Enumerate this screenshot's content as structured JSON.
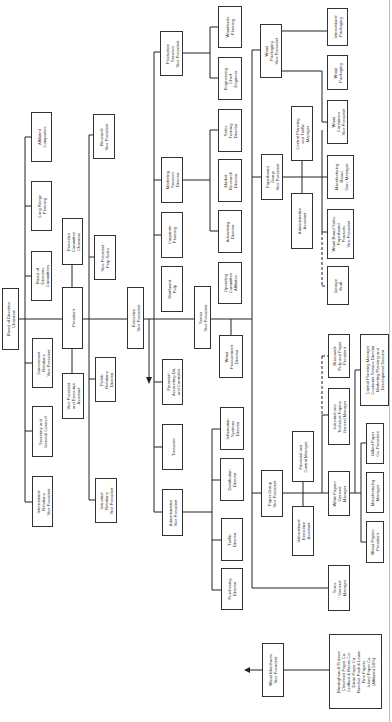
{
  "chart_title": "",
  "nodes": [
    {
      "id": "board",
      "label": "Board of Directors\nChairman",
      "x": 2,
      "y": 288,
      "w": 17,
      "h": 62
    },
    {
      "id": "president",
      "label": "President",
      "x": 62,
      "y": 287,
      "w": 21,
      "h": 62
    },
    {
      "id": "vp_exec_asst",
      "label": "Vice President\nand Executive\nAssistant",
      "x": 62,
      "y": 373,
      "w": 22,
      "h": 46
    },
    {
      "id": "exec_committee",
      "label": "Executive\nCommittee\nChairman",
      "x": 62,
      "y": 218,
      "w": 21,
      "h": 47
    },
    {
      "id": "affiliated",
      "label": "Affiliated\nCompanies",
      "x": 31,
      "y": 112,
      "w": 21,
      "h": 50
    },
    {
      "id": "long_range",
      "label": "Long Range\nPlanning",
      "x": 31,
      "y": 181,
      "w": 21,
      "h": 50
    },
    {
      "id": "board_committees",
      "label": "Board of\nDirectors\nCommittees",
      "x": 31,
      "y": 251,
      "w": 21,
      "h": 50
    },
    {
      "id": "govt_relations",
      "label": "Government\nRelations\nVice President",
      "x": 32,
      "y": 338,
      "w": 21,
      "h": 50
    },
    {
      "id": "secretary",
      "label": "Secretary and\nGeneral Counsel",
      "x": 32,
      "y": 406,
      "w": 21,
      "h": 51
    },
    {
      "id": "intl_relations",
      "label": "International\nRelations\nVice President",
      "x": 32,
      "y": 476,
      "w": 21,
      "h": 51
    },
    {
      "id": "research_vp",
      "label": "Research\nVice President",
      "x": 93,
      "y": 114,
      "w": 22,
      "h": 45
    },
    {
      "id": "vp_pulp_sales",
      "label": "Vice President\nPulp Sales",
      "x": 94,
      "y": 235,
      "w": 22,
      "h": 45
    },
    {
      "id": "public_relations",
      "label": "Public\nRelations\nDirector",
      "x": 95,
      "y": 357,
      "w": 21,
      "h": 45
    },
    {
      "id": "industrial_relations",
      "label": "Industrial\nRelations\nVice President",
      "x": 95,
      "y": 478,
      "w": 22,
      "h": 45
    },
    {
      "id": "exec_vp",
      "label": "Executive\nVice President",
      "x": 127,
      "y": 287,
      "w": 17,
      "h": 62
    },
    {
      "id": "financial_vp",
      "label": "Financial\nAccounting Dir.\nand Controller",
      "x": 162,
      "y": 359,
      "w": 21,
      "h": 46
    },
    {
      "id": "treasurer",
      "label": "Treasurer",
      "x": 162,
      "y": 424,
      "w": 21,
      "h": 46
    },
    {
      "id": "admin_vp",
      "label": "Administrative\nVice President",
      "x": 162,
      "y": 489,
      "w": 21,
      "h": 47
    },
    {
      "id": "production_vp",
      "label": "Production\nServices\nVice President",
      "x": 160,
      "y": 31,
      "w": 23,
      "h": 45
    },
    {
      "id": "marketing_dir",
      "label": "Marketing\nServices\nDirector",
      "x": 161,
      "y": 157,
      "w": 22,
      "h": 46
    },
    {
      "id": "corporate_planning",
      "label": "Corporate\nPlanning",
      "x": 161,
      "y": 212,
      "w": 22,
      "h": 46
    },
    {
      "id": "northwest_pulp",
      "label": "Northwest\nPulp",
      "x": 161,
      "y": 266,
      "w": 22,
      "h": 46
    },
    {
      "id": "senior_vp",
      "label": "Senior\nVice President",
      "x": 194,
      "y": 286,
      "w": 17,
      "h": 63
    },
    {
      "id": "woodlands",
      "label": "Woodlands\nPlanning",
      "x": 218,
      "y": 6,
      "w": 24,
      "h": 42
    },
    {
      "id": "engineering",
      "label": "Engineering\nChief\nEngineer",
      "x": 218,
      "y": 57,
      "w": 24,
      "h": 43
    },
    {
      "id": "sales_training",
      "label": "Sales\nTraining\nDirector",
      "x": 218,
      "y": 109,
      "w": 24,
      "h": 43
    },
    {
      "id": "market_research",
      "label": "Market\nResearch\nDirector",
      "x": 218,
      "y": 159,
      "w": 24,
      "h": 43
    },
    {
      "id": "advertising",
      "label": "Advertising\nDirector",
      "x": 218,
      "y": 210,
      "w": 24,
      "h": 43
    },
    {
      "id": "operating_committee",
      "label": "Operating\nCommittee\nAffiliates",
      "x": 218,
      "y": 262,
      "w": 24,
      "h": 42
    },
    {
      "id": "wood_procurement",
      "label": "Wood\nProcurement\nDirector",
      "x": 219,
      "y": 335,
      "w": 24,
      "h": 43
    },
    {
      "id": "info_systems",
      "label": "Information\nSystems\nDirector",
      "x": 220,
      "y": 407,
      "w": 24,
      "h": 43
    },
    {
      "id": "distribution",
      "label": "Distribution\nDirector",
      "x": 220,
      "y": 458,
      "w": 24,
      "h": 43
    },
    {
      "id": "traffic",
      "label": "Traffic\nDirector",
      "x": 221,
      "y": 518,
      "w": 22,
      "h": 43
    },
    {
      "id": "purchasing",
      "label": "Purchasing\nDirector",
      "x": 221,
      "y": 568,
      "w": 22,
      "h": 42
    },
    {
      "id": "paper_group_vp",
      "label": "Paper Group\nVice President",
      "x": 261,
      "y": 470,
      "w": 22,
      "h": 47
    },
    {
      "id": "paperboard_vp",
      "label": "Paperboard\nGroup\nVice President",
      "x": 261,
      "y": 154,
      "w": 22,
      "h": 46
    },
    {
      "id": "wood_packaging_vp",
      "label": "Wood\nPackaging\nVice President",
      "x": 260,
      "y": 24,
      "w": 22,
      "h": 54
    },
    {
      "id": "financial_control",
      "label": "Financial and\nControl Manager",
      "x": 292,
      "y": 431,
      "w": 22,
      "h": 51
    },
    {
      "id": "intl_exec_asst",
      "label": "International\nExecutive\nAssistant",
      "x": 292,
      "y": 506,
      "w": 22,
      "h": 50
    },
    {
      "id": "central_planning",
      "label": "Central Planning\nand Traffic\nManager",
      "x": 291,
      "y": 106,
      "w": 22,
      "h": 55
    },
    {
      "id": "admin_assistant",
      "label": "Administrative\nAssistant",
      "x": 291,
      "y": 193,
      "w": 22,
      "h": 56
    },
    {
      "id": "intl_packaging",
      "label": "International\nPackaging",
      "x": 327,
      "y": 8,
      "w": 21,
      "h": 38
    },
    {
      "id": "wood_packaging",
      "label": "Wood\nPackaging",
      "x": 327,
      "y": 55,
      "w": 21,
      "h": 35
    },
    {
      "id": "wood_containers_vp",
      "label": "Wood\nContainers\nVice President",
      "x": 327,
      "y": 100,
      "w": 21,
      "h": 44
    },
    {
      "id": "manufacturing_board",
      "label": "Manufacturing\nBoard\nGen. Manager",
      "x": 327,
      "y": 155,
      "w": 27,
      "h": 44
    },
    {
      "id": "wood_board_sales",
      "label": "Wood Board Sales\nPaperboard\nProducts\nVice President",
      "x": 327,
      "y": 209,
      "w": 27,
      "h": 50
    },
    {
      "id": "george_kraft",
      "label": "George\nKraft",
      "x": 327,
      "y": 266,
      "w": 22,
      "h": 39
    },
    {
      "id": "brunswick",
      "label": "Brunswick\nPulp and Paper\nPresident",
      "x": 328,
      "y": 334,
      "w": 22,
      "h": 44
    },
    {
      "id": "industrial_technical",
      "label": "Industrial and\nTechnical Papers\nGeneral Manager",
      "x": 328,
      "y": 388,
      "w": 22,
      "h": 57
    },
    {
      "id": "white_papers",
      "label": "White Papers\nGeneral\nManager",
      "x": 328,
      "y": 471,
      "w": 22,
      "h": 45
    },
    {
      "id": "control_planning",
      "label": "Control Planning Manager\nCustomer Service Director\nMarketing Planning and\nDevelopment Director",
      "x": 360,
      "y": 334,
      "w": 29,
      "h": 72
    },
    {
      "id": "gilbert_paper",
      "label": "Gilbert Paper\nCo. President",
      "x": 366,
      "y": 423,
      "w": 18,
      "h": 41
    },
    {
      "id": "manufacturing_mgr",
      "label": "Manufacturing\nManager",
      "x": 366,
      "y": 472,
      "w": 18,
      "h": 41
    },
    {
      "id": "wood_papers_pres",
      "label": "Wood Papers\nPresident",
      "x": 366,
      "y": 521,
      "w": 18,
      "h": 42
    },
    {
      "id": "trans_general",
      "label": "Trans\nGeneral\nManager",
      "x": 328,
      "y": 565,
      "w": 22,
      "h": 46
    },
    {
      "id": "wood_merchants_vp",
      "label": "Wood Merchants\nVice President",
      "x": 262,
      "y": 643,
      "w": 22,
      "h": 54
    },
    {
      "id": "merchant_list",
      "label": "Birmingham & Prosser\nCleveland Paper Co.\nCrafford & Bonds Co.\nDixon Paper Co.\nBaecher Pack & Lewis\nFine Papers\nIsland Paper Co.\n(Affiliated 50%)",
      "x": 329,
      "y": 634,
      "w": 53,
      "h": 75
    }
  ]
}
